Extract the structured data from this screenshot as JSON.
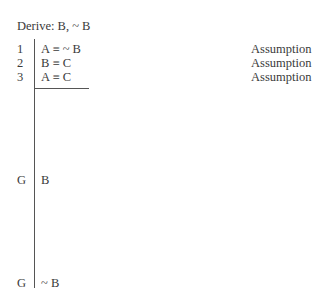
{
  "title": "Derive: B, ~ B",
  "lines": [
    {
      "num": "1",
      "formula": "A ≡ ~ B",
      "justification": "Assumption"
    },
    {
      "num": "2",
      "formula": "B ≡ C",
      "justification": "Assumption"
    },
    {
      "num": "3",
      "formula": "A ≡ C",
      "justification": "Assumption"
    }
  ],
  "goals": [
    {
      "num": "G",
      "formula": "B"
    },
    {
      "num": "G",
      "formula": "~ B"
    }
  ]
}
